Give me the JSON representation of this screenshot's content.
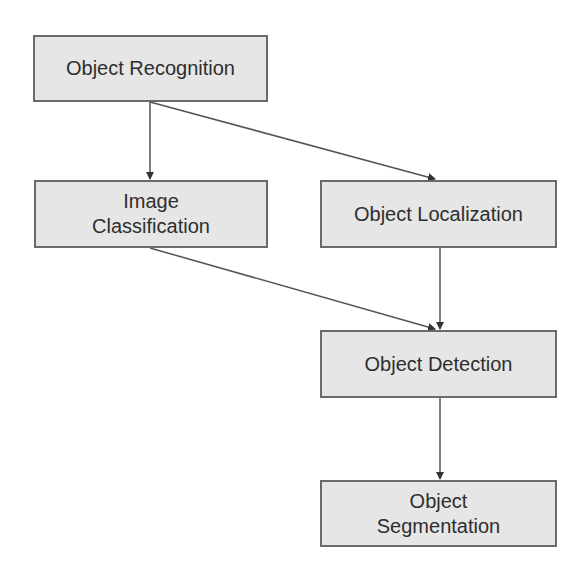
{
  "diagram": {
    "type": "flowchart",
    "colors": {
      "node_fill": "#e6e6e6",
      "node_border": "#6a6a6a",
      "text": "#2e2e2e",
      "edge": "#555555"
    },
    "nodes": [
      {
        "id": "object-recognition",
        "label": "Object Recognition"
      },
      {
        "id": "image-classification",
        "label": "Image\nClassification"
      },
      {
        "id": "object-localization",
        "label": "Object Localization"
      },
      {
        "id": "object-detection",
        "label": "Object Detection"
      },
      {
        "id": "object-segmentation",
        "label": "Object\nSegmentation"
      }
    ],
    "edges": [
      {
        "from": "object-recognition",
        "to": "image-classification"
      },
      {
        "from": "object-recognition",
        "to": "object-localization"
      },
      {
        "from": "image-classification",
        "to": "object-detection"
      },
      {
        "from": "object-localization",
        "to": "object-detection"
      },
      {
        "from": "object-detection",
        "to": "object-segmentation"
      }
    ]
  }
}
